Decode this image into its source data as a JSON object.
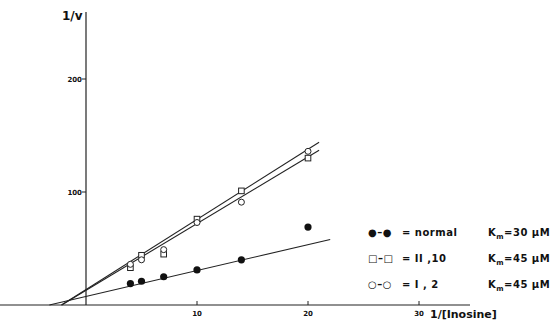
{
  "chart_data": {
    "type": "scatter",
    "title": "",
    "xlabel": "1/[Inosine]",
    "ylabel": "1/v",
    "xticks": [
      10,
      20,
      30
    ],
    "yticks": [
      100,
      200
    ],
    "xlim": [
      -8,
      35
    ],
    "ylim": [
      -5,
      260
    ],
    "grid": false,
    "legend_position": "right",
    "series": [
      {
        "name": "normal",
        "marker": "filled-circle",
        "km": "Km=30 µM",
        "x": [
          4,
          5,
          7,
          10,
          14,
          20
        ],
        "y": [
          19,
          21,
          25,
          31,
          40,
          69
        ],
        "fit_line": {
          "x": [
            -3.3,
            22
          ],
          "y": [
            0,
            58
          ]
        }
      },
      {
        "name": "II,10",
        "marker": "open-square",
        "km": "Km=45 µM",
        "x": [
          4,
          5,
          7,
          10,
          14,
          20
        ],
        "y": [
          33,
          44,
          45,
          76,
          101,
          130
        ],
        "fit_line": {
          "x": [
            -2.2,
            21
          ],
          "y": [
            0,
            137
          ]
        }
      },
      {
        "name": "I,2",
        "marker": "open-circle",
        "km": "Km=45 µM",
        "x": [
          4,
          5,
          7,
          10,
          14,
          20
        ],
        "y": [
          36,
          40,
          49,
          73,
          91,
          136
        ],
        "fit_line": {
          "x": [
            -2.2,
            21
          ],
          "y": [
            0,
            144
          ]
        }
      }
    ]
  },
  "axes": {
    "ylabel": "1/v",
    "xlabel": "1/[Inosine]",
    "xtick_labels": [
      "10",
      "20",
      "30"
    ],
    "ytick_labels": [
      "100",
      "200"
    ]
  },
  "legend": [
    {
      "symbol": "●–●",
      "name": "= normal",
      "km_prefix": "K",
      "km_sub": "m",
      "km_value": "=30 µM"
    },
    {
      "symbol": "□–□",
      "name": "= II ,10",
      "km_prefix": "K",
      "km_sub": "m",
      "km_value": "=45 µM"
    },
    {
      "symbol": "○–○",
      "name": "= I , 2",
      "km_prefix": "K",
      "km_sub": "m",
      "km_value": "=45 µM"
    }
  ]
}
